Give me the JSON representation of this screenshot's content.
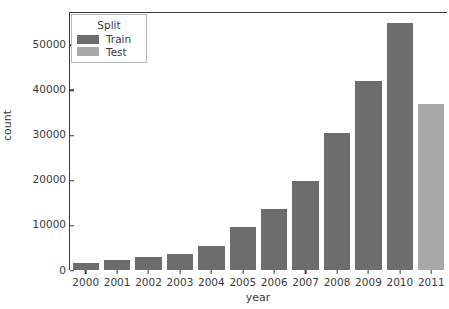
{
  "chart_data": {
    "type": "bar",
    "title": "",
    "xlabel": "year",
    "ylabel": "count",
    "categories": [
      "2000",
      "2001",
      "2002",
      "2003",
      "2004",
      "2005",
      "2006",
      "2007",
      "2008",
      "2009",
      "2010",
      "2011"
    ],
    "values": [
      1600,
      2300,
      2900,
      3600,
      5400,
      9600,
      13500,
      19800,
      30400,
      42000,
      54700,
      36900
    ],
    "bar_split": [
      "Train",
      "Train",
      "Train",
      "Train",
      "Train",
      "Train",
      "Train",
      "Train",
      "Train",
      "Train",
      "Train",
      "Test"
    ],
    "series": [
      {
        "name": "Train",
        "color": "#6d6d6d",
        "x": [
          "2000",
          "2001",
          "2002",
          "2003",
          "2004",
          "2005",
          "2006",
          "2007",
          "2008",
          "2009",
          "2010"
        ],
        "values": [
          1600,
          2300,
          2900,
          3600,
          5400,
          9600,
          13500,
          19800,
          30400,
          42000,
          54700
        ]
      },
      {
        "name": "Test",
        "color": "#a9a9a9",
        "x": [
          "2011"
        ],
        "values": [
          36900
        ]
      }
    ],
    "ylim": [
      0,
      57000
    ],
    "yticks": [
      0,
      10000,
      20000,
      30000,
      40000,
      50000
    ],
    "ytick_labels": [
      "0",
      "10000",
      "20000",
      "30000",
      "40000",
      "50000"
    ],
    "xtick_labels": [
      "2000",
      "2001",
      "2002",
      "2003",
      "2004",
      "2005",
      "2006",
      "2007",
      "2008",
      "2009",
      "2010",
      "2011"
    ],
    "grid": false,
    "legend": {
      "title": "Split",
      "position": "upper left",
      "entries": [
        {
          "label": "Train",
          "color": "#6d6d6d"
        },
        {
          "label": "Test",
          "color": "#a9a9a9"
        }
      ]
    }
  }
}
